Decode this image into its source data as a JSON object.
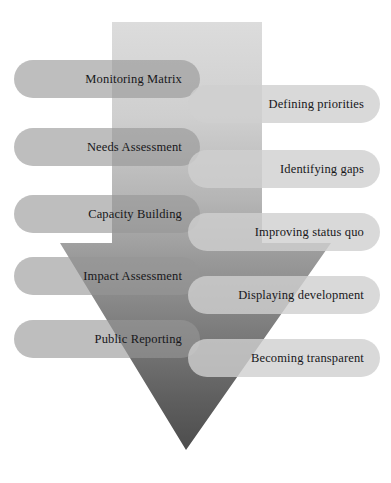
{
  "diagram": {
    "type": "inverted-triangle-funnel",
    "title": "",
    "canvas": {
      "width": 391,
      "height": 483
    },
    "funnel": {
      "name": "funnel-shape",
      "gradient_top_color": "#dcdcdc",
      "gradient_bottom_color": "#4f4f4f",
      "top_left_x": 112,
      "top_right_x": 262,
      "top_y": 22,
      "shoulder_y": 243,
      "shoulder_left_x": 60,
      "shoulder_right_x": 331,
      "tip_x": 186,
      "tip_y": 450
    },
    "left_column": {
      "name": "left-stage-column",
      "fill_color": "#969696",
      "text_color": "#17171a",
      "items": [
        {
          "label": "Monitoring Matrix",
          "top": 60
        },
        {
          "label": "Needs Assessment",
          "top": 128
        },
        {
          "label": "Capacity Building",
          "top": 195
        },
        {
          "label": "Impact Assessment",
          "top": 257
        },
        {
          "label": "Public Reporting",
          "top": 320
        }
      ]
    },
    "right_column": {
      "name": "right-outcome-column",
      "fill_color": "#cfcfcf",
      "text_color": "#17171a",
      "items": [
        {
          "label": "Defining priorities",
          "top": 85
        },
        {
          "label": "Identifying gaps",
          "top": 150
        },
        {
          "label": "Improving status quo",
          "top": 213
        },
        {
          "label": "Displaying development",
          "top": 276
        },
        {
          "label": "Becoming transparent",
          "top": 339
        }
      ]
    }
  }
}
